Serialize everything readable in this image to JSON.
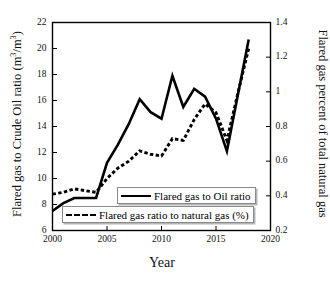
{
  "chart_data": {
    "type": "line",
    "title": "",
    "xlabel": "Year",
    "ylabel": "Flared gas to Crude Oil ratio (m3/m3)",
    "ylabel_right": "Flared gas percent of total natural gas",
    "xlim": [
      2000,
      2020
    ],
    "ylim": [
      6,
      22
    ],
    "ylim_right": [
      0.2,
      1.4
    ],
    "xticks": [
      "2000",
      "2005",
      "2010",
      "2015",
      "2020"
    ],
    "xtick_values": [
      2000,
      2005,
      2010,
      2015,
      2020
    ],
    "yticks": [
      "6",
      "8",
      "10",
      "12",
      "14",
      "16",
      "18",
      "20",
      "22"
    ],
    "ytick_values": [
      6,
      8,
      10,
      12,
      14,
      16,
      18,
      20,
      22
    ],
    "yticks_right": [
      "0.2",
      "0.4",
      "0.6",
      "0.8",
      "1",
      "1.2",
      "1.4"
    ],
    "ytick_right_values": [
      0.2,
      0.4,
      0.6,
      0.8,
      1.0,
      1.2,
      1.4
    ],
    "grid": false,
    "legend_position": "lower-center",
    "x": [
      2000,
      2001,
      2002,
      2003,
      2004,
      2005,
      2006,
      2007,
      2008,
      2009,
      2010,
      2011,
      2012,
      2013,
      2014,
      2015,
      2016,
      2017,
      2018
    ],
    "series": [
      {
        "name": "Flared gas to Oil ratio",
        "axis": "left",
        "style": "solid",
        "values": [
          7.5,
          8.1,
          8.5,
          8.5,
          8.5,
          11.2,
          12.6,
          14.2,
          16.1,
          15.1,
          14.6,
          17.9,
          15.5,
          16.9,
          16.3,
          14.6,
          12.1,
          16.4,
          20.7
        ]
      },
      {
        "name": "Flared gas ratio to natural gas (%)",
        "axis": "right",
        "style": "dashed",
        "values": [
          0.41,
          0.42,
          0.44,
          0.43,
          0.42,
          0.5,
          0.56,
          0.6,
          0.66,
          0.64,
          0.63,
          0.73,
          0.72,
          0.84,
          0.93,
          0.88,
          0.72,
          0.99,
          1.25
        ]
      }
    ]
  },
  "axes": {
    "left_title_prefix": "Flared gas to Crude Oil ratio (m",
    "left_title_sup1": "3",
    "left_title_mid": "/m",
    "left_title_sup2": "3",
    "left_title_suffix": ")",
    "right_title": "Flared gas percent of total natural gas",
    "x_title": "Year"
  },
  "legend": {
    "items": [
      {
        "label": "Flared gas to Oil ratio",
        "style": "solid"
      },
      {
        "label": "Flared gas ratio to natural gas (%)",
        "style": "dashed"
      }
    ]
  }
}
